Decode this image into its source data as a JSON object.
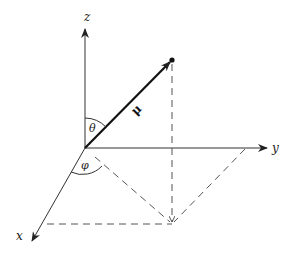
{
  "diagram": {
    "type": "spherical-coordinates",
    "labels": {
      "z_axis": "z",
      "y_axis": "y",
      "x_axis": "x",
      "vector": "μ",
      "polar_angle": "θ",
      "azimuthal_angle": "φ"
    },
    "colors": {
      "ink": "#222222",
      "dashed": "#555555",
      "background": "#ffffff"
    }
  }
}
